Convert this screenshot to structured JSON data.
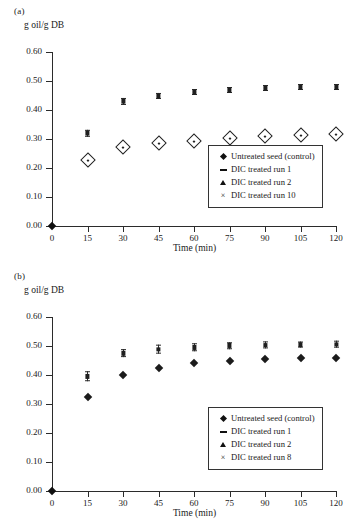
{
  "figure": {
    "panels": [
      {
        "id": "a",
        "panel_label": "(a)",
        "y_axis_title": "g oil/g DB",
        "x_axis_title": "Time (min)"
      },
      {
        "id": "b",
        "panel_label": "(b)",
        "y_axis_title": "g oil/g DB",
        "x_axis_title": "Time (min)"
      }
    ]
  },
  "chart_data": [
    {
      "type": "scatter",
      "title": "(a)",
      "xlabel": "Time (min)",
      "ylabel": "g oil/g DB",
      "xlim": [
        0,
        120
      ],
      "ylim": [
        0.0,
        0.6
      ],
      "xticks": [
        0,
        15,
        30,
        45,
        60,
        75,
        90,
        105,
        120
      ],
      "yticks": [
        0.0,
        0.1,
        0.2,
        0.3,
        0.4,
        0.5,
        0.6
      ],
      "ytick_labels": [
        "0.00",
        "0.10",
        "0.20",
        "0.30",
        "0.40",
        "0.50",
        "0.60"
      ],
      "xtick_labels": [
        "0",
        "15",
        "30",
        "45",
        "60",
        "75",
        "90",
        "105",
        "120"
      ],
      "grid": false,
      "legend_position": "lower right",
      "x": [
        0,
        15,
        30,
        45,
        60,
        75,
        90,
        105,
        120
      ],
      "series": [
        {
          "name": "Untreated seed (control)",
          "marker": "open-diamond",
          "values": [
            0.0,
            0.228,
            0.273,
            0.286,
            0.294,
            0.304,
            0.311,
            0.315,
            0.318
          ]
        },
        {
          "name": "DIC treated run 1",
          "marker": "dash",
          "values": [
            0.0,
            0.318,
            0.428,
            0.447,
            0.46,
            0.468,
            0.474,
            0.477,
            0.478
          ]
        },
        {
          "name": "DIC treated run 2",
          "marker": "triangle",
          "values": [
            0.0,
            0.322,
            0.431,
            0.45,
            0.462,
            0.47,
            0.476,
            0.479,
            0.48
          ]
        },
        {
          "name": "DIC treated run 10",
          "marker": "cross",
          "values": [
            0.0,
            0.32,
            0.43,
            0.449,
            0.461,
            0.469,
            0.475,
            0.478,
            0.479
          ]
        }
      ]
    },
    {
      "type": "scatter",
      "title": "(b)",
      "xlabel": "Time (min)",
      "ylabel": "g oil/g DB",
      "xlim": [
        0,
        120
      ],
      "ylim": [
        0.0,
        0.6
      ],
      "xticks": [
        0,
        15,
        30,
        45,
        60,
        75,
        90,
        105,
        120
      ],
      "yticks": [
        0.0,
        0.1,
        0.2,
        0.3,
        0.4,
        0.5,
        0.6
      ],
      "ytick_labels": [
        "0.00",
        "0.10",
        "0.20",
        "0.30",
        "0.40",
        "0.50",
        "0.60"
      ],
      "xtick_labels": [
        "0",
        "15",
        "30",
        "45",
        "60",
        "75",
        "90",
        "105",
        "120"
      ],
      "grid": false,
      "legend_position": "lower right",
      "x": [
        0,
        15,
        30,
        45,
        60,
        75,
        90,
        105,
        120
      ],
      "series": [
        {
          "name": "Untreated seed (control)",
          "marker": "solid-diamond",
          "values": [
            0.0,
            0.323,
            0.4,
            0.425,
            0.443,
            0.45,
            0.456,
            0.459,
            0.46
          ]
        },
        {
          "name": "DIC treated run 1",
          "marker": "dash",
          "values": [
            0.0,
            0.4,
            0.476,
            0.492,
            0.498,
            0.503,
            0.505,
            0.507,
            0.507
          ]
        },
        {
          "name": "DIC treated run 2",
          "marker": "triangle",
          "values": [
            0.0,
            0.403,
            0.479,
            0.494,
            0.5,
            0.505,
            0.507,
            0.508,
            0.508
          ]
        },
        {
          "name": "DIC treated run 8",
          "marker": "cross",
          "values": [
            0.0,
            0.388,
            0.47,
            0.482,
            0.492,
            0.497,
            0.5,
            0.502,
            0.503
          ]
        }
      ]
    }
  ],
  "legends": [
    {
      "rows": [
        {
          "symbol": "diamond",
          "label": "Untreated seed (control)"
        },
        {
          "symbol": "dash",
          "label": "DIC treated run 1"
        },
        {
          "symbol": "triangle",
          "label": "DIC treated run 2"
        },
        {
          "symbol": "cross",
          "label": "DIC treated run 10"
        }
      ]
    },
    {
      "rows": [
        {
          "symbol": "diamond",
          "label": "Untreated seed (control)"
        },
        {
          "symbol": "dash",
          "label": "DIC treated run 1"
        },
        {
          "symbol": "triangle",
          "label": "DIC treated run 2"
        },
        {
          "symbol": "cross",
          "label": "DIC treated run 8"
        }
      ]
    }
  ],
  "symbols": {
    "cross_glyph": "×"
  }
}
